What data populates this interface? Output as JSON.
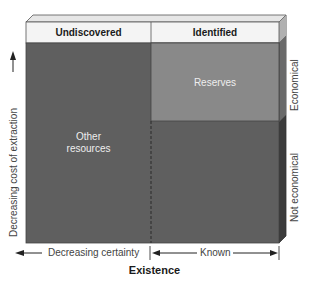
{
  "diagram": {
    "columns": [
      {
        "label": "Undiscovered"
      },
      {
        "label": "Identified"
      }
    ],
    "regions": {
      "reserves": "Reserves",
      "other_resources_line1": "Other",
      "other_resources_line2": "resources"
    },
    "right_labels": {
      "top": "Economical",
      "bottom": "Not economical"
    },
    "left_axis": {
      "label": "Decreasing cost of extraction",
      "arrow": "up-arrow"
    },
    "bottom_axis": {
      "left_label": "Decreasing certainty",
      "right_label": "Known",
      "title": "Existence"
    },
    "colors": {
      "header": "#f4f4f4",
      "top_face": "#e6e6e6",
      "front": "#5f5f5f",
      "reserves": "#898989",
      "side": "#3c3c3c"
    }
  }
}
